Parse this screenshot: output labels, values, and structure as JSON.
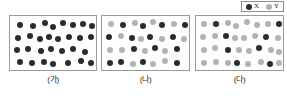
{
  "figure": {
    "legend": {
      "entries": [
        {
          "symbol_name": "black-circle-icon",
          "label": "X",
          "color": "#2b2b2b",
          "kind": "x"
        },
        {
          "symbol_name": "gray-circle-icon",
          "label": "Y",
          "color": "#b3b3b3",
          "kind": "y"
        }
      ]
    },
    "panels": [
      {
        "caption": "(가)",
        "counts": {
          "X": 29,
          "Y": 0
        },
        "particles": [
          {
            "kind": "x",
            "x": 7,
            "y": 6
          },
          {
            "kind": "x",
            "x": 20,
            "y": 7
          },
          {
            "kind": "x",
            "x": 32,
            "y": 4
          },
          {
            "kind": "x",
            "x": 40,
            "y": 8
          },
          {
            "kind": "x",
            "x": 50,
            "y": 4
          },
          {
            "kind": "x",
            "x": 60,
            "y": 6
          },
          {
            "kind": "x",
            "x": 70,
            "y": 5
          },
          {
            "kind": "x",
            "x": 79,
            "y": 7
          },
          {
            "kind": "x",
            "x": 5,
            "y": 19
          },
          {
            "kind": "x",
            "x": 17,
            "y": 17
          },
          {
            "kind": "x",
            "x": 27,
            "y": 20
          },
          {
            "kind": "x",
            "x": 36,
            "y": 18
          },
          {
            "kind": "x",
            "x": 45,
            "y": 20
          },
          {
            "kind": "x",
            "x": 56,
            "y": 18
          },
          {
            "kind": "x",
            "x": 67,
            "y": 19
          },
          {
            "kind": "x",
            "x": 78,
            "y": 18
          },
          {
            "kind": "x",
            "x": 4,
            "y": 31
          },
          {
            "kind": "x",
            "x": 15,
            "y": 30
          },
          {
            "kind": "x",
            "x": 28,
            "y": 32
          },
          {
            "kind": "x",
            "x": 38,
            "y": 30
          },
          {
            "kind": "x",
            "x": 49,
            "y": 32
          },
          {
            "kind": "x",
            "x": 60,
            "y": 30
          },
          {
            "kind": "x",
            "x": 72,
            "y": 33
          },
          {
            "kind": "x",
            "x": 7,
            "y": 43
          },
          {
            "kind": "x",
            "x": 19,
            "y": 44
          },
          {
            "kind": "x",
            "x": 31,
            "y": 43
          },
          {
            "kind": "x",
            "x": 40,
            "y": 45
          },
          {
            "kind": "x",
            "x": 55,
            "y": 44
          },
          {
            "kind": "x",
            "x": 68,
            "y": 42
          },
          {
            "kind": "x",
            "x": 78,
            "y": 44
          }
        ]
      },
      {
        "caption": "(나)",
        "counts": {
          "X": 15,
          "Y": 15
        },
        "particles": [
          {
            "kind": "y",
            "x": 6,
            "y": 5
          },
          {
            "kind": "x",
            "x": 18,
            "y": 6
          },
          {
            "kind": "y",
            "x": 30,
            "y": 4
          },
          {
            "kind": "x",
            "x": 38,
            "y": 7
          },
          {
            "kind": "y",
            "x": 48,
            "y": 3
          },
          {
            "kind": "x",
            "x": 57,
            "y": 6
          },
          {
            "kind": "y",
            "x": 69,
            "y": 5
          },
          {
            "kind": "x",
            "x": 80,
            "y": 6
          },
          {
            "kind": "x",
            "x": 4,
            "y": 18
          },
          {
            "kind": "y",
            "x": 16,
            "y": 17
          },
          {
            "kind": "x",
            "x": 27,
            "y": 19
          },
          {
            "kind": "y",
            "x": 36,
            "y": 20
          },
          {
            "kind": "x",
            "x": 45,
            "y": 18
          },
          {
            "kind": "y",
            "x": 57,
            "y": 20
          },
          {
            "kind": "x",
            "x": 68,
            "y": 18
          },
          {
            "kind": "y",
            "x": 79,
            "y": 20
          },
          {
            "kind": "y",
            "x": 5,
            "y": 31
          },
          {
            "kind": "y",
            "x": 17,
            "y": 31
          },
          {
            "kind": "x",
            "x": 29,
            "y": 30
          },
          {
            "kind": "y",
            "x": 40,
            "y": 32
          },
          {
            "kind": "x",
            "x": 50,
            "y": 29
          },
          {
            "kind": "y",
            "x": 60,
            "y": 32
          },
          {
            "kind": "x",
            "x": 72,
            "y": 30
          },
          {
            "kind": "x",
            "x": 5,
            "y": 44
          },
          {
            "kind": "x",
            "x": 16,
            "y": 43
          },
          {
            "kind": "y",
            "x": 28,
            "y": 45
          },
          {
            "kind": "x",
            "x": 38,
            "y": 43
          },
          {
            "kind": "y",
            "x": 48,
            "y": 45
          },
          {
            "kind": "y",
            "x": 60,
            "y": 42
          },
          {
            "kind": "x",
            "x": 72,
            "y": 44
          }
        ]
      },
      {
        "caption": "(다)",
        "counts": {
          "X": 8,
          "Y": 22
        },
        "particles": [
          {
            "kind": "y",
            "x": 5,
            "y": 5
          },
          {
            "kind": "x",
            "x": 17,
            "y": 5
          },
          {
            "kind": "y",
            "x": 29,
            "y": 4
          },
          {
            "kind": "y",
            "x": 37,
            "y": 7
          },
          {
            "kind": "y",
            "x": 48,
            "y": 3
          },
          {
            "kind": "y",
            "x": 58,
            "y": 6
          },
          {
            "kind": "y",
            "x": 69,
            "y": 5
          },
          {
            "kind": "x",
            "x": 80,
            "y": 5
          },
          {
            "kind": "y",
            "x": 4,
            "y": 18
          },
          {
            "kind": "y",
            "x": 16,
            "y": 17
          },
          {
            "kind": "x",
            "x": 27,
            "y": 17
          },
          {
            "kind": "y",
            "x": 36,
            "y": 19
          },
          {
            "kind": "y",
            "x": 45,
            "y": 19
          },
          {
            "kind": "y",
            "x": 56,
            "y": 17
          },
          {
            "kind": "x",
            "x": 67,
            "y": 18
          },
          {
            "kind": "y",
            "x": 79,
            "y": 19
          },
          {
            "kind": "y",
            "x": 5,
            "y": 31
          },
          {
            "kind": "y",
            "x": 16,
            "y": 29
          },
          {
            "kind": "x",
            "x": 29,
            "y": 31
          },
          {
            "kind": "y",
            "x": 40,
            "y": 31
          },
          {
            "kind": "y",
            "x": 50,
            "y": 32
          },
          {
            "kind": "x",
            "x": 60,
            "y": 29
          },
          {
            "kind": "y",
            "x": 72,
            "y": 31
          },
          {
            "kind": "y",
            "x": 80,
            "y": 33
          },
          {
            "kind": "y",
            "x": 5,
            "y": 44
          },
          {
            "kind": "y",
            "x": 17,
            "y": 43
          },
          {
            "kind": "y",
            "x": 29,
            "y": 44
          },
          {
            "kind": "x",
            "x": 38,
            "y": 44
          },
          {
            "kind": "y",
            "x": 49,
            "y": 45
          },
          {
            "kind": "y",
            "x": 62,
            "y": 43
          },
          {
            "kind": "x",
            "x": 71,
            "y": 45
          },
          {
            "kind": "y",
            "x": 80,
            "y": 44
          }
        ]
      }
    ]
  }
}
